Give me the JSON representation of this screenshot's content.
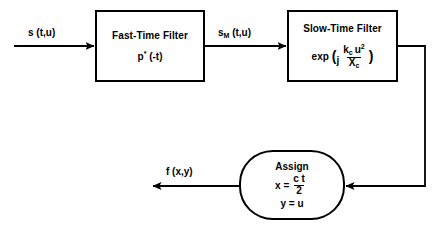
{
  "diagram": {
    "type": "signal-processing-block-diagram",
    "stroke_color": "#000000",
    "background_color": "#ffffff",
    "blocks": [
      {
        "id": "fast-time-filter",
        "shape": "rectangle",
        "title": "Fast-Time Filter",
        "formula_plain": "p* (-t)",
        "formula_base": "p",
        "formula_sup": "*",
        "formula_tail": " (-t)",
        "x": 95,
        "y": 10,
        "w": 110,
        "h": 72
      },
      {
        "id": "slow-time-filter",
        "shape": "rectangle",
        "title": "Slow-Time Filter",
        "formula_plain": "exp ( j kc u^2 / Xc )",
        "exp_label": "exp",
        "open_paren": "(",
        "imaginary_unit": "j",
        "numerator_base": "k",
        "numerator_sub": "c",
        "numerator_var": "u",
        "numerator_exp": "2",
        "denominator_base": "X",
        "denominator_sub": "c",
        "close_paren": ")",
        "x": 287,
        "y": 10,
        "w": 111,
        "h": 72
      },
      {
        "id": "assign",
        "shape": "rounded-rectangle",
        "title": "Assign",
        "line1_lhs": "x  =",
        "line1_num": "c t",
        "line1_den": "2",
        "line2": "y = u",
        "x": 239,
        "y": 150,
        "w": 106,
        "h": 70
      }
    ],
    "signals": [
      {
        "id": "input-signal",
        "label_plain": "s (t,u)",
        "label_base": "s",
        "label_tail": " (t,u)",
        "x": 28,
        "y": 28,
        "arrow_from_x": 14,
        "arrow_to_x": 95,
        "arrow_y": 46
      },
      {
        "id": "intermediate-signal",
        "label_plain": "sM (t,u)",
        "label_base": "s",
        "label_sub": "M",
        "label_tail": " (t,u)",
        "x": 218,
        "y": 28,
        "arrow_from_x": 205,
        "arrow_to_x": 287,
        "arrow_y": 46
      },
      {
        "id": "output-signal",
        "label_plain": "f (x,y)",
        "label_base": "f",
        "label_tail": " (x,y)",
        "x": 166,
        "y": 167,
        "arrow_from_x": 239,
        "arrow_to_x": 152,
        "arrow_y": 186
      },
      {
        "id": "feedback-path",
        "label_plain": "",
        "from_x": 398,
        "from_y": 46,
        "corner_x": 425,
        "corner_y": 186,
        "to_x": 345,
        "to_y": 186
      }
    ]
  }
}
